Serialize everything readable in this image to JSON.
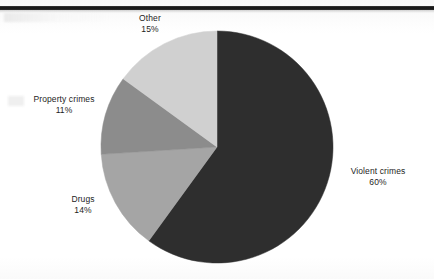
{
  "page": {
    "background_color": "#fdfdfd",
    "rule_color": "#111111"
  },
  "chart_data": {
    "type": "pie",
    "title": "",
    "subtitle": "",
    "xlabel": "",
    "ylabel": "",
    "legend_position": "none",
    "labels_position": "outside",
    "start_angle_deg": 0,
    "direction": "clockwise",
    "units": "percent",
    "categories": [
      "Violent crimes",
      "Drugs",
      "Property crimes",
      "Other"
    ],
    "values": [
      60,
      14,
      11,
      15
    ],
    "colors": [
      "#2e2e2e",
      "#a5a5a5",
      "#8c8c8c",
      "#d0d0d0"
    ],
    "slices": [
      {
        "name": "Violent crimes",
        "value": 60,
        "label": "Violent crimes",
        "percent_text": "60%",
        "color": "#2e2e2e",
        "start_deg": 0,
        "end_deg": 216
      },
      {
        "name": "Drugs",
        "value": 14,
        "label": "Drugs",
        "percent_text": "14%",
        "color": "#a5a5a5",
        "start_deg": 216,
        "end_deg": 266.4
      },
      {
        "name": "Property crimes",
        "value": 11,
        "label": "Property crimes",
        "percent_text": "11%",
        "color": "#8c8c8c",
        "start_deg": 266.4,
        "end_deg": 306
      },
      {
        "name": "Other",
        "value": 15,
        "label": "Other",
        "percent_text": "15%",
        "color": "#d0d0d0",
        "start_deg": 306,
        "end_deg": 360
      }
    ],
    "geometry": {
      "center_x": 217,
      "center_y": 147,
      "radius": 116
    }
  }
}
